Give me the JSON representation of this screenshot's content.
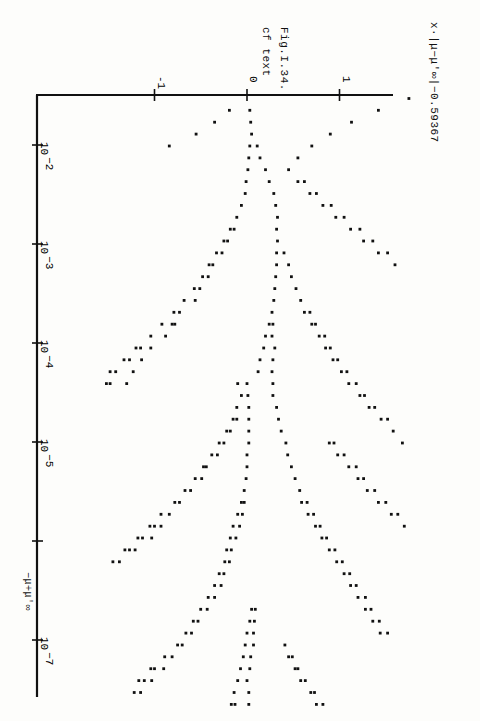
{
  "figure": {
    "caption": "Fig.I.34.",
    "note": "cf text",
    "y_axis_label": "x·|μ−μ'∞|−0.59367",
    "x_axis_label": "−μ+μ'∞",
    "orientation": "rotated 90° clockwise"
  },
  "chart_data": {
    "type": "scatter",
    "title": "Fig.I.34.",
    "subtitle": "cf text",
    "xlabel": "−μ+μ'∞ (log scale)",
    "ylabel": "x·|μ−μ'∞|^−0.59367",
    "x_scale": "log",
    "x_ticks": [
      "10^-2",
      "10^-3",
      "10^-4",
      "10^-5",
      "",
      "10^-7"
    ],
    "x_tick_values": [
      -2,
      -3,
      -4,
      -5,
      -6,
      -7
    ],
    "y_ticks": [
      "-1",
      "0",
      "1"
    ],
    "y_tick_values": [
      -1,
      0,
      1
    ],
    "xlim_log10": [
      -1.5,
      -7.5
    ],
    "ylim": [
      -1.0,
      1.55
    ],
    "grid": false,
    "legend": null,
    "rows_note": "each row: log10(x) and list of y values of the dots plotted at that x",
    "rows": [
      {
        "lx": -1.53,
        "y": [
          1.75
        ]
      },
      {
        "lx": -1.65,
        "y": [
          -0.19,
          0.03,
          1.42
        ]
      },
      {
        "lx": -1.77,
        "y": [
          -0.35,
          0.04,
          1.13
        ]
      },
      {
        "lx": -1.89,
        "y": [
          -0.55,
          0.05,
          0.9
        ]
      },
      {
        "lx": -2.01,
        "y": [
          -0.84,
          0.03,
          0.11,
          0.7
        ]
      },
      {
        "lx": -2.13,
        "y": [
          0.02,
          0.14,
          0.55
        ]
      },
      {
        "lx": -2.25,
        "y": [
          0.01,
          0.2,
          0.45
        ]
      },
      {
        "lx": -2.37,
        "y": [
          -0.01,
          0.24,
          0.55,
          0.62
        ]
      },
      {
        "lx": -2.49,
        "y": [
          -0.02,
          0.29,
          0.68,
          0.75
        ]
      },
      {
        "lx": -2.61,
        "y": [
          -0.06,
          0.31,
          0.82,
          0.91
        ]
      },
      {
        "lx": -2.73,
        "y": [
          -0.11,
          0.33,
          0.96,
          1.05
        ]
      },
      {
        "lx": -2.85,
        "y": [
          -0.18,
          -0.14,
          0.32,
          1.12,
          1.22
        ]
      },
      {
        "lx": -2.97,
        "y": [
          -0.25,
          -0.21,
          0.33,
          1.26,
          1.36
        ]
      },
      {
        "lx": -3.09,
        "y": [
          -0.33,
          -0.27,
          0.32,
          0.4,
          1.42,
          1.52
        ]
      },
      {
        "lx": -3.21,
        "y": [
          -0.41,
          -0.37,
          0.32,
          0.45,
          1.6
        ]
      },
      {
        "lx": -3.33,
        "y": [
          -0.48,
          -0.42,
          0.31,
          0.48
        ]
      },
      {
        "lx": -3.45,
        "y": [
          -0.57,
          -0.51,
          0.3,
          0.53
        ]
      },
      {
        "lx": -3.57,
        "y": [
          -0.68,
          -0.56,
          0.29,
          0.58
        ]
      },
      {
        "lx": -3.69,
        "y": [
          -0.79,
          -0.73,
          0.27,
          0.62,
          0.68
        ]
      },
      {
        "lx": -3.81,
        "y": [
          -0.92,
          -0.81,
          -0.78,
          0.24,
          0.28,
          0.7,
          0.74
        ]
      },
      {
        "lx": -3.93,
        "y": [
          -1.04,
          -0.88,
          0.2,
          0.27,
          0.78,
          0.84
        ]
      },
      {
        "lx": -4.05,
        "y": [
          -1.2,
          -1.15,
          -1.04,
          0.18,
          0.3,
          0.85,
          0.9
        ]
      },
      {
        "lx": -4.17,
        "y": [
          -1.33,
          -1.27,
          -1.14,
          0.14,
          0.28,
          0.93,
          0.98
        ]
      },
      {
        "lx": -4.29,
        "y": [
          -1.48,
          -1.42,
          -1.23,
          0.12,
          0.27,
          1.02,
          1.08
        ]
      },
      {
        "lx": -4.41,
        "y": [
          -1.52,
          -1.48,
          -1.3,
          -0.1,
          0.0,
          0.28,
          1.1,
          1.18
        ]
      },
      {
        "lx": -4.53,
        "y": [
          -0.06,
          0.01,
          0.28,
          1.22,
          1.27
        ]
      },
      {
        "lx": -4.65,
        "y": [
          -0.11,
          0.02,
          0.32,
          1.32,
          1.38
        ]
      },
      {
        "lx": -4.77,
        "y": [
          -0.15,
          -0.11,
          0.02,
          0.34,
          1.45,
          1.52
        ]
      },
      {
        "lx": -4.89,
        "y": [
          -0.22,
          -0.18,
          0.02,
          0.37,
          1.58
        ]
      },
      {
        "lx": -5.01,
        "y": [
          -0.3,
          -0.25,
          0.02,
          0.42,
          0.89,
          0.94,
          1.68
        ]
      },
      {
        "lx": -5.13,
        "y": [
          -0.38,
          -0.32,
          0.0,
          0.44,
          0.98,
          1.05
        ]
      },
      {
        "lx": -5.25,
        "y": [
          -0.47,
          -0.44,
          0.0,
          0.48,
          1.1,
          1.18
        ]
      },
      {
        "lx": -5.37,
        "y": [
          -0.56,
          -0.49,
          -0.01,
          0.52,
          1.2,
          1.26
        ]
      },
      {
        "lx": -5.49,
        "y": [
          -0.67,
          -0.61,
          -0.03,
          0.57,
          1.3,
          1.38
        ]
      },
      {
        "lx": -5.61,
        "y": [
          -0.78,
          -0.73,
          -0.06,
          -0.03,
          0.59,
          0.65,
          1.42,
          1.5
        ]
      },
      {
        "lx": -5.73,
        "y": [
          -0.93,
          -0.84,
          -0.1,
          -0.05,
          0.66,
          0.72,
          1.56,
          1.63
        ]
      },
      {
        "lx": -5.85,
        "y": [
          -1.05,
          -1.0,
          -0.93,
          -0.15,
          -0.08,
          0.74,
          0.79,
          1.7
        ]
      },
      {
        "lx": -5.97,
        "y": [
          -1.18,
          -1.13,
          -1.03,
          -0.18,
          -0.12,
          0.81,
          0.86
        ]
      },
      {
        "lx": -6.09,
        "y": [
          -1.32,
          -1.27,
          -1.21,
          -0.22,
          -0.17,
          0.89,
          0.95
        ]
      },
      {
        "lx": -6.21,
        "y": [
          -1.45,
          -1.38,
          -0.24,
          -0.19,
          0.97,
          1.03
        ]
      },
      {
        "lx": -6.33,
        "y": [
          -0.3,
          -0.25,
          1.05,
          1.11
        ]
      },
      {
        "lx": -6.45,
        "y": [
          -0.35,
          -0.28,
          1.12,
          1.18
        ]
      },
      {
        "lx": -6.57,
        "y": [
          -0.42,
          -0.35,
          1.2,
          1.28
        ]
      },
      {
        "lx": -6.69,
        "y": [
          -0.5,
          -0.43,
          0.05,
          0.09,
          1.28,
          1.34
        ]
      },
      {
        "lx": -6.81,
        "y": [
          -0.58,
          -0.53,
          0.03,
          0.08,
          1.36,
          1.43
        ]
      },
      {
        "lx": -6.93,
        "y": [
          -0.66,
          -0.6,
          0.0,
          0.07,
          1.44,
          1.52
        ]
      },
      {
        "lx": -7.05,
        "y": [
          -0.75,
          -0.7,
          -0.02,
          0.07,
          0.41
        ]
      },
      {
        "lx": -7.17,
        "y": [
          -0.89,
          -0.81,
          -0.04,
          0.04,
          0.45,
          0.49
        ]
      },
      {
        "lx": -7.29,
        "y": [
          -1.04,
          -1.0,
          -0.9,
          -0.07,
          0.03,
          0.52,
          0.55
        ]
      },
      {
        "lx": -7.41,
        "y": [
          -1.17,
          -1.11,
          -1.03,
          -0.1,
          0.0,
          0.58,
          0.63
        ]
      },
      {
        "lx": -7.53,
        "y": [
          -1.22,
          -1.15,
          -0.14,
          0.02,
          0.69,
          0.73
        ]
      },
      {
        "lx": -7.65,
        "y": [
          -0.17,
          -0.13,
          0.02,
          0.75,
          0.82
        ]
      }
    ]
  }
}
